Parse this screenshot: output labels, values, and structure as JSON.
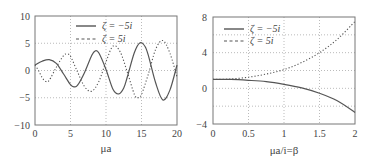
{
  "chart_data": [
    {
      "type": "line",
      "title": "",
      "xlabel": "μa",
      "ylabel": "",
      "xlim": [
        0,
        20
      ],
      "ylim": [
        -10,
        10
      ],
      "xticks": [
        "0",
        "5",
        "10",
        "15",
        "20"
      ],
      "yticks": [
        "-10",
        "-5",
        "0",
        "5",
        "10"
      ],
      "grid": true,
      "legend_position": "upper center",
      "series": [
        {
          "name": "ζ = −5i",
          "style": "solid",
          "x": [
            0,
            1,
            2,
            3,
            4,
            5,
            5.5,
            6,
            7,
            8,
            8.5,
            9,
            10,
            11,
            11.8,
            12.5,
            13,
            14,
            14.8,
            15.5,
            16,
            17,
            18,
            19,
            20
          ],
          "y": [
            1.0,
            1.7,
            2.0,
            1.3,
            -0.6,
            -2.6,
            -3.0,
            -2.7,
            -0.3,
            2.8,
            3.6,
            3.2,
            0.2,
            -3.5,
            -4.3,
            -3.2,
            -1.2,
            3.3,
            5.1,
            4.4,
            2.6,
            -2.3,
            -5.4,
            -3.6,
            1.0
          ]
        },
        {
          "name": "ζ = 5i",
          "style": "dotted",
          "x": [
            0,
            0.5,
            1,
            1.5,
            2,
            3,
            4,
            4.5,
            5,
            6,
            7,
            8,
            9,
            10,
            11,
            12,
            13,
            14,
            14.5,
            15,
            16,
            17,
            18,
            19,
            20
          ],
          "y": [
            1.0,
            0.0,
            -1.3,
            -2.0,
            -1.8,
            0.6,
            2.7,
            3.0,
            2.6,
            -0.3,
            -3.0,
            -3.8,
            -2.0,
            1.6,
            4.5,
            3.4,
            -0.3,
            -4.4,
            -5.0,
            -4.4,
            -0.5,
            3.9,
            5.5,
            3.2,
            -1.2
          ]
        }
      ]
    },
    {
      "type": "line",
      "title": "",
      "xlabel": "μa/i=β",
      "ylabel": "",
      "xlim": [
        0,
        2
      ],
      "ylim": [
        -4,
        8
      ],
      "xticks": [
        "0",
        "0.5",
        "1",
        "1.5",
        "2"
      ],
      "yticks": [
        "-4",
        "0",
        "4",
        "8"
      ],
      "grid": true,
      "legend_position": "upper left",
      "series": [
        {
          "name": "ζ = −5i",
          "style": "solid",
          "x": [
            0,
            0.25,
            0.5,
            0.75,
            1,
            1.25,
            1.5,
            1.75,
            2
          ],
          "y": [
            1.0,
            1.0,
            0.9,
            0.75,
            0.45,
            0.05,
            -0.55,
            -1.4,
            -2.7
          ]
        },
        {
          "name": "ζ = 5i",
          "style": "dotted",
          "x": [
            0,
            0.25,
            0.5,
            0.75,
            1,
            1.25,
            1.5,
            1.75,
            2
          ],
          "y": [
            1.0,
            1.05,
            1.25,
            1.6,
            2.1,
            2.9,
            4.0,
            5.5,
            7.5
          ]
        }
      ]
    }
  ],
  "left": {
    "xlabel": "μa",
    "yticks": [
      "−10",
      "−5",
      "0",
      "5",
      "10"
    ],
    "xticks": [
      "0",
      "5",
      "10",
      "15",
      "20"
    ],
    "legend": [
      "ζ = −5i",
      "ζ = 5i"
    ]
  },
  "right": {
    "xlabel": "μa/i=β",
    "yticks": [
      "−4",
      "0",
      "4",
      "8"
    ],
    "xticks": [
      "0",
      "0.5",
      "1",
      "1.5",
      "2"
    ],
    "legend": [
      "ζ = −5i",
      "ζ = 5i"
    ]
  }
}
